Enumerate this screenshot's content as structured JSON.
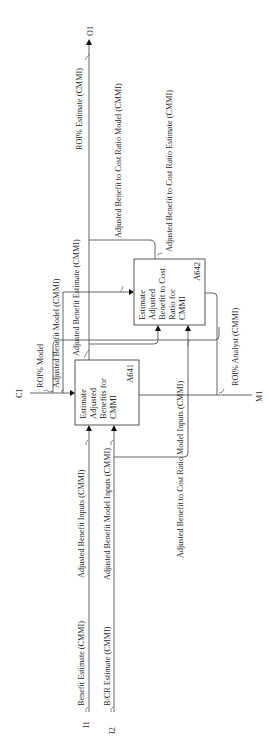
{
  "diagram": {
    "type": "IDEF0",
    "orientation": "rotated-90-ccw",
    "boxes": [
      {
        "id": "A641",
        "title_lines": [
          "Estimate",
          "Adjusted",
          "Benefits for",
          "CMMI"
        ],
        "node": "A641"
      },
      {
        "id": "A642",
        "title_lines": [
          "Estimate",
          "Adjusted",
          "Benefit to Cost",
          "Ratio for",
          "CMMI"
        ],
        "node": "A642"
      }
    ],
    "tunnels": {
      "c1": "C1",
      "o1": "O1",
      "m1": "M1",
      "i1": "I1",
      "i2": "I2"
    },
    "arrows": {
      "benefit_estimate": "Benefit Estimate (CMMI)",
      "bcr_estimate": "B/CR Estimate (CMMI)",
      "adj_benefit_inputs": "Adjusted Benefit Inputs (CMMI)",
      "adj_benefit_model_inputs": "Adjusted Benefit Model Inputs (CMMI)",
      "adj_bcr_model_inputs": "Adjusted Benefit to Cost Ratio Model Inputs (CMMI)",
      "roi_model": "ROI% Model",
      "adj_benefit_model": "Adjusted Benefit Model (CMMI)",
      "adj_benefit_estimate": "Adjusted Benefit Estimate (CMMI)",
      "adj_bcr_model": "Adjusted Benefit to Cost Ratio Model (CMMI)",
      "adj_bcr_estimate": "Adjusted Benefit to Cost Ratio Estimate (CMMI)",
      "roi_estimate": "ROI% Estimate (CMMI)",
      "roi_analyst": "ROI% Analyst (CMMI)"
    }
  }
}
